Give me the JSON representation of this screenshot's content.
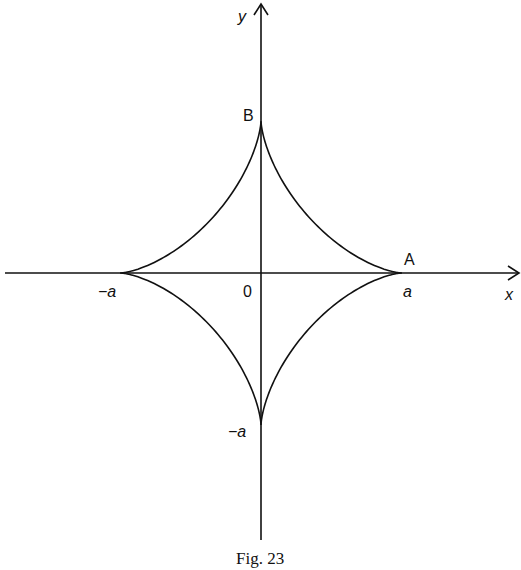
{
  "figure": {
    "caption": "Fig. 23",
    "axes": {
      "x_label": "x",
      "y_label": "y",
      "origin_label": "0"
    },
    "points": {
      "A": {
        "label": "A",
        "x_tick": "a"
      },
      "B": {
        "label": "B"
      },
      "neg_x_tick": "−a",
      "neg_y_tick": "−a"
    },
    "curve": "astroid x^(2/3) + y^(2/3) = a^(2/3)",
    "colors": {
      "ink": "#111111",
      "background": "#ffffff"
    }
  }
}
